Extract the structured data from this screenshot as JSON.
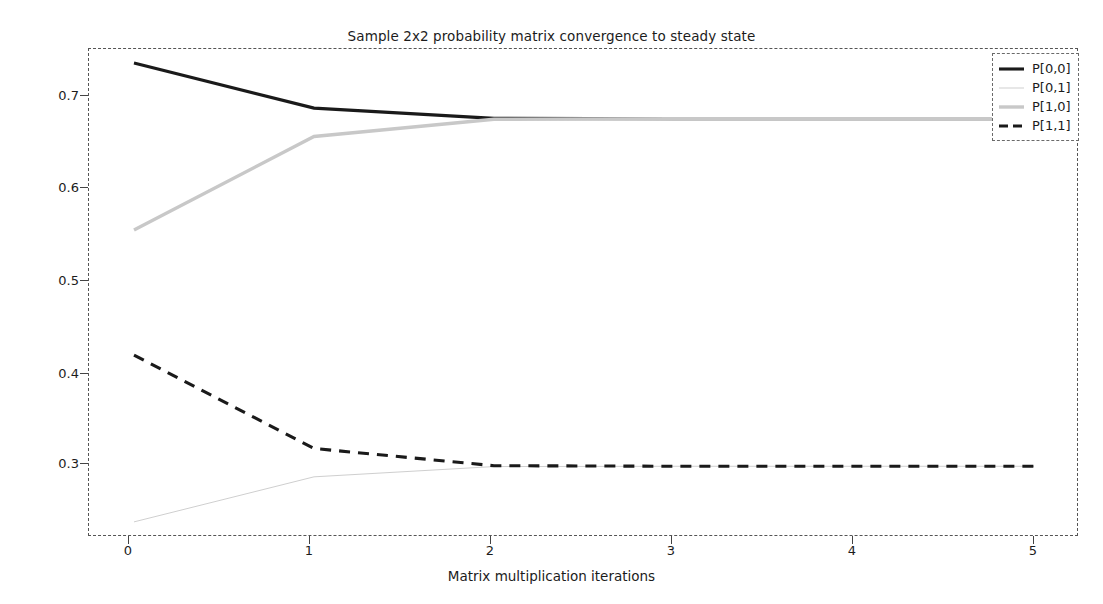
{
  "chart_data": {
    "type": "line",
    "title": "Sample 2x2 probability matrix convergence to steady state",
    "xlabel": "Matrix multiplication iterations",
    "ylabel": "",
    "x": [
      0,
      1,
      2,
      3,
      4,
      5
    ],
    "xlim": [
      -0.25,
      5.25
    ],
    "ylim": [
      0.2655,
      0.7335
    ],
    "xticks": [
      "0",
      "1",
      "2",
      "3",
      "4",
      "5"
    ],
    "yticks": [
      "0.3",
      "0.4",
      "0.5",
      "0.6",
      "0.7"
    ],
    "ytick_values": [
      0.3,
      0.4,
      0.5,
      0.6,
      0.7
    ],
    "grid": false,
    "legend_position": "upper right",
    "series": [
      {
        "name": "P[0,0]",
        "values": [
          0.72,
          0.6768,
          0.66694,
          0.66668,
          0.66667,
          0.66667
        ],
        "color": "#1a1a1a",
        "style": "solid",
        "width": 3.1
      },
      {
        "name": "P[0,1]",
        "values": [
          0.28,
          0.3232,
          0.33306,
          0.33332,
          0.33333,
          0.33333
        ],
        "color": "#cfcfcf",
        "style": "solid",
        "width": 1.0
      },
      {
        "name": "P[1,0]",
        "values": [
          0.56,
          0.6496,
          0.66613,
          0.66664,
          0.66667,
          0.66667
        ],
        "color": "#c8c8c8",
        "style": "solid",
        "width": 3.4
      },
      {
        "name": "P[1,1]",
        "values": [
          0.44,
          0.3504,
          0.33387,
          0.33336,
          0.33333,
          0.33333
        ],
        "color": "#1a1a1a",
        "style": "dashed",
        "width": 3.1
      }
    ]
  },
  "legend": {
    "entries": [
      "P[0,0]",
      "P[0,1]",
      "P[1,0]",
      "P[1,1]"
    ]
  },
  "colors": {
    "axis": "#555555",
    "text": "#1c1c1c",
    "background": "#ffffff"
  }
}
